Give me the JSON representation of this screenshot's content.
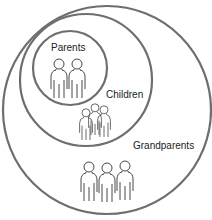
{
  "diagram": {
    "type": "nested-circles",
    "stroke_color": "#6e6e6e",
    "figure_color": "#333333",
    "circles": [
      {
        "name": "grandparents",
        "label": "Grandparents",
        "figures": 3
      },
      {
        "name": "children",
        "label": "Children",
        "figures": 3
      },
      {
        "name": "parents",
        "label": "Parents",
        "figures": 2
      }
    ]
  }
}
